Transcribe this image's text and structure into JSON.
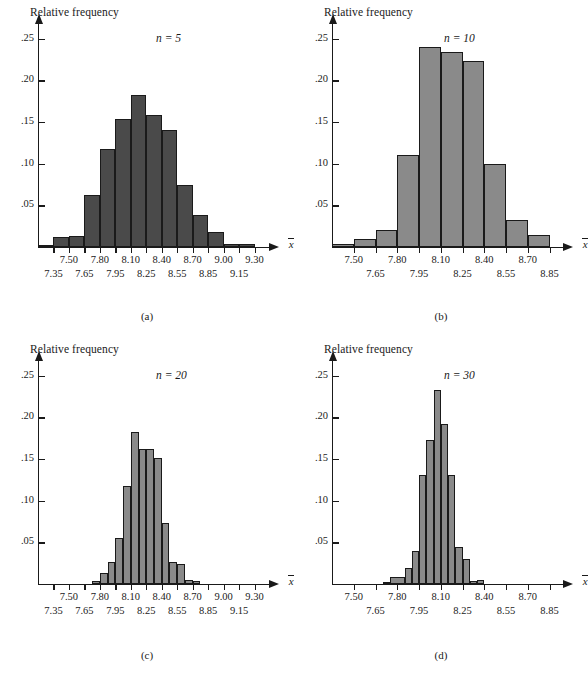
{
  "figure": {
    "background": "#ffffff",
    "axis_color": "#1a1a1a"
  },
  "common": {
    "ylabel": "Relative frequency",
    "xaxis_label": "x",
    "ytick_labels": [
      ".05",
      ".10",
      ".15",
      ".20",
      ".25"
    ],
    "ytick_values": [
      0.05,
      0.1,
      0.15,
      0.2,
      0.25
    ],
    "ymax": 0.27
  },
  "panels": [
    {
      "id": "a",
      "caption": "(a)",
      "n_label": "n = 5",
      "n_value": 5,
      "bar_color": "#4a4a4a",
      "xtick_row1": [
        "7.50",
        "7.80",
        "8.10",
        "8.40",
        "8.70",
        "9.00",
        "9.30"
      ],
      "xtick_row2": [
        "7.35",
        "7.65",
        "7.95",
        "8.25",
        "8.55",
        "8.85",
        "9.15"
      ]
    },
    {
      "id": "b",
      "caption": "(b)",
      "n_label": "n = 10",
      "n_value": 10,
      "bar_color": "#8a8a8a",
      "xtick_row1": [
        "7.50",
        "7.80",
        "8.10",
        "8.40",
        "8.70"
      ],
      "xtick_row2": [
        "7.65",
        "7.95",
        "8.25",
        "8.55",
        "8.85"
      ]
    },
    {
      "id": "c",
      "caption": "(c)",
      "n_label": "n = 20",
      "n_value": 20,
      "bar_color": "#8a8a8a",
      "xtick_row1": [
        "7.50",
        "7.80",
        "8.10",
        "8.40",
        "8.70",
        "9.00",
        "9.30"
      ],
      "xtick_row2": [
        "7.35",
        "7.65",
        "7.95",
        "8.25",
        "8.55",
        "8.85",
        "9.15"
      ]
    },
    {
      "id": "d",
      "caption": "(d)",
      "n_label": "n = 30",
      "n_value": 30,
      "bar_color": "#8a8a8a",
      "xtick_row1": [
        "7.50",
        "7.80",
        "8.10",
        "8.40",
        "8.70"
      ],
      "xtick_row2": [
        "7.65",
        "7.95",
        "8.25",
        "8.55",
        "8.85"
      ]
    }
  ],
  "chart_data": [
    {
      "type": "bar",
      "panel": "a",
      "title": "n = 5",
      "subtitle": "(a)",
      "xlabel": "x",
      "ylabel": "Relative frequency",
      "ylim": [
        0,
        0.27
      ],
      "xlim": [
        7.2,
        9.45
      ],
      "grid": false,
      "legend": "none",
      "bin_width": 0.15,
      "bin_edges": [
        7.2,
        7.35,
        7.5,
        7.65,
        7.8,
        7.95,
        8.1,
        8.25,
        8.4,
        8.55,
        8.7,
        8.85,
        9.0,
        9.15,
        9.3,
        9.45
      ],
      "categories": [
        "7.20-7.35",
        "7.35-7.50",
        "7.50-7.65",
        "7.65-7.80",
        "7.80-7.95",
        "7.95-8.10",
        "8.10-8.25",
        "8.25-8.40",
        "8.40-8.55",
        "8.55-8.70",
        "8.70-8.85",
        "8.85-9.00",
        "9.00-9.15",
        "9.15-9.30",
        "9.30-9.45"
      ],
      "values": [
        0.003,
        0.012,
        0.013,
        0.062,
        0.118,
        0.154,
        0.183,
        0.159,
        0.14,
        0.075,
        0.038,
        0.018,
        0.004,
        0.004,
        0.0
      ]
    },
    {
      "type": "bar",
      "panel": "b",
      "title": "n = 10",
      "subtitle": "(b)",
      "xlabel": "x",
      "ylabel": "Relative frequency",
      "ylim": [
        0,
        0.27
      ],
      "xlim": [
        7.35,
        8.95
      ],
      "grid": false,
      "legend": "none",
      "bin_width": 0.15,
      "bin_edges": [
        7.35,
        7.5,
        7.65,
        7.8,
        7.95,
        8.1,
        8.25,
        8.4,
        8.55,
        8.7,
        8.85
      ],
      "categories": [
        "7.35-7.50",
        "7.50-7.65",
        "7.65-7.80",
        "7.80-7.95",
        "7.95-8.10",
        "8.10-8.25",
        "8.25-8.40",
        "8.40-8.55",
        "8.55-8.70",
        "8.70-8.85"
      ],
      "values": [
        0.004,
        0.01,
        0.02,
        0.111,
        0.24,
        0.234,
        0.223,
        0.1,
        0.033,
        0.014
      ]
    },
    {
      "type": "bar",
      "panel": "c",
      "title": "n = 20",
      "subtitle": "(c)",
      "xlabel": "x",
      "ylabel": "Relative frequency",
      "ylim": [
        0,
        0.27
      ],
      "xlim": [
        7.2,
        9.45
      ],
      "grid": false,
      "legend": "none",
      "bin_width": 0.075,
      "bin_edges": [
        7.725,
        7.8,
        7.875,
        7.95,
        8.025,
        8.1,
        8.175,
        8.25,
        8.325,
        8.4,
        8.475,
        8.55,
        8.625,
        8.7,
        8.775
      ],
      "categories": [
        "7.725-7.800",
        "7.800-7.875",
        "7.875-7.950",
        "7.950-8.025",
        "8.025-8.100",
        "8.100-8.175",
        "8.175-8.250",
        "8.250-8.325",
        "8.325-8.400",
        "8.400-8.475",
        "8.475-8.550",
        "8.550-8.625",
        "8.625-8.700",
        "8.700-8.775"
      ],
      "values": [
        0.004,
        0.013,
        0.027,
        0.055,
        0.118,
        0.183,
        0.162,
        0.162,
        0.151,
        0.073,
        0.027,
        0.024,
        0.005,
        0.004
      ]
    },
    {
      "type": "bar",
      "panel": "d",
      "title": "n = 30",
      "subtitle": "(d)",
      "xlabel": "x",
      "ylabel": "Relative frequency",
      "ylim": [
        0,
        0.27
      ],
      "xlim": [
        7.35,
        8.95
      ],
      "grid": false,
      "legend": "none",
      "bin_width": 0.05,
      "bin_edges": [
        7.7,
        7.75,
        7.85,
        7.9,
        7.95,
        8.0,
        8.05,
        8.1,
        8.15,
        8.2,
        8.25,
        8.3,
        8.35,
        8.4,
        8.45,
        8.5,
        8.55,
        8.7,
        8.75
      ],
      "categories": [
        "7.70-7.75",
        "7.85-7.90",
        "7.90-7.95",
        "7.95-8.00",
        "8.00-8.05",
        "8.05-8.10",
        "8.10-8.15",
        "8.15-8.20",
        "8.20-8.25",
        "8.25-8.30",
        "8.30-8.35",
        "8.35-8.40",
        "8.40-8.45",
        "8.45-8.50",
        "8.50-8.55",
        "8.70-8.75"
      ],
      "values": [
        0.003,
        0.008,
        0.019,
        0.04,
        0.131,
        0.173,
        0.233,
        0.192,
        0.131,
        0.044,
        0.03,
        0.004,
        0.005
      ]
    }
  ]
}
